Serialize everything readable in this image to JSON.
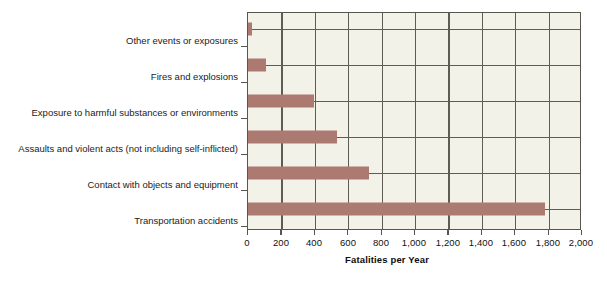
{
  "chart_data": {
    "type": "bar",
    "orientation": "horizontal",
    "title": "",
    "xlabel": "Fatalities per Year",
    "ylabel": "",
    "categories": [
      "Other events or exposures",
      "Fires and explosions",
      "Exposure to harmful substances or environments",
      "Assaults and violent acts (not including self-inflicted)",
      "Contact with objects and equipment",
      "Transportation accidents"
    ],
    "values": [
      25,
      110,
      400,
      535,
      730,
      1790
    ],
    "xlim": [
      0,
      2000
    ],
    "xticks": [
      0,
      200,
      400,
      600,
      800,
      1000,
      1200,
      1400,
      1600,
      1800,
      2000
    ],
    "xtick_labels": [
      "0",
      "200",
      "400",
      "600",
      "800",
      "1,000",
      "1,200",
      "1,400",
      "1,600",
      "1,800",
      "2,000"
    ],
    "grid": "both",
    "legend": "none",
    "bar_color": "#ac7a71",
    "plot_background": "#f3f2e9",
    "axis_color": "#57564f",
    "gridline_color": "#5d5c55"
  },
  "scan": {
    "top_remnant": "· · · · · · ·"
  }
}
